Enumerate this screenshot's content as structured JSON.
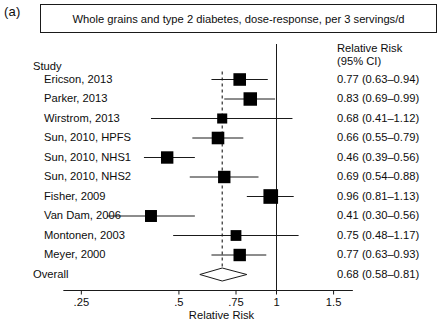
{
  "panel": {
    "letter": "(a)"
  },
  "title": {
    "text": "Whole grains and type 2 diabetes, dose-response, per 3 servings/d"
  },
  "headers": {
    "study": "Study",
    "rr_line1": "Relative Risk",
    "rr_line2": "(95% CI)"
  },
  "axis": {
    "label": "Relative Risk",
    "scale": "log",
    "ticks": [
      0.25,
      0.5,
      0.75,
      1,
      1.5
    ],
    "tick_labels": [
      ".25",
      ".5",
      ".75",
      "1",
      "1.5"
    ],
    "min": 0.22,
    "max": 1.72,
    "reference_line": 1,
    "pooled_line": 0.68
  },
  "chart_data": {
    "type": "forest",
    "title": "Whole grains and type 2 diabetes, dose-response, per 3 servings/d",
    "xlabel": "Relative Risk",
    "ylabel": "",
    "xscale": "log",
    "xlim": [
      0.22,
      1.72
    ],
    "xticks": [
      0.25,
      0.5,
      0.75,
      1,
      1.5
    ],
    "reference_line": 1,
    "pooled_line": 0.68,
    "effect_measure": "Relative Risk (95% CI)",
    "studies": [
      {
        "label": "Ericson, 2013",
        "rr": 0.77,
        "lcl": 0.63,
        "ucl": 0.94,
        "weight": 0.62,
        "text": "0.77 (0.63–0.94)"
      },
      {
        "label": "Parker, 2013",
        "rr": 0.83,
        "lcl": 0.69,
        "ucl": 0.99,
        "weight": 0.72,
        "text": "0.83 (0.69–0.99)"
      },
      {
        "label": "Wirstrom, 2013",
        "rr": 0.68,
        "lcl": 0.41,
        "ucl": 1.12,
        "weight": 0.34,
        "text": "0.68 (0.41–1.12)"
      },
      {
        "label": "Sun, 2010, HPFS",
        "rr": 0.66,
        "lcl": 0.55,
        "ucl": 0.79,
        "weight": 0.62,
        "text": "0.66 (0.55–0.79)"
      },
      {
        "label": "Sun, 2010, NHS1",
        "rr": 0.46,
        "lcl": 0.39,
        "ucl": 0.56,
        "weight": 0.6,
        "text": "0.46 (0.39–0.56)"
      },
      {
        "label": "Sun, 2010, NHS2",
        "rr": 0.69,
        "lcl": 0.54,
        "ucl": 0.88,
        "weight": 0.6,
        "text": "0.69 (0.54–0.88)"
      },
      {
        "label": "Fisher, 2009",
        "rr": 0.96,
        "lcl": 0.81,
        "ucl": 1.13,
        "weight": 0.85,
        "text": "0.96 (0.81–1.13)"
      },
      {
        "label": "Van Dam, 2006",
        "rr": 0.41,
        "lcl": 0.3,
        "ucl": 0.56,
        "weight": 0.55,
        "text": "0.41 (0.30–0.56)"
      },
      {
        "label": "Montonen, 2003",
        "rr": 0.75,
        "lcl": 0.48,
        "ucl": 1.17,
        "weight": 0.42,
        "text": "0.75 (0.48–1.17)"
      },
      {
        "label": "Meyer, 2000",
        "rr": 0.77,
        "lcl": 0.63,
        "ucl": 0.93,
        "weight": 0.6,
        "text": "0.77 (0.63–0.93)"
      }
    ],
    "overall": {
      "label": "Overall",
      "rr": 0.68,
      "lcl": 0.58,
      "ucl": 0.81,
      "text": "0.68 (0.58–0.81)"
    }
  },
  "colors": {
    "marker": "#000000",
    "line": "#1a1a1a",
    "diamond_fill": "#ffffff",
    "text": "#0d0d0d"
  }
}
